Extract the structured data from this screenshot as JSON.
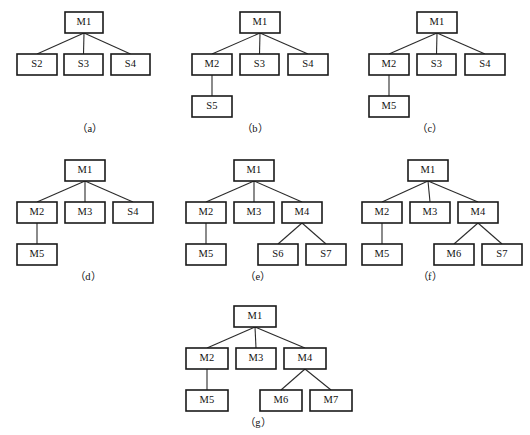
{
  "figure": {
    "background_color": "#ffffff",
    "box_stroke_color": "#1a1a1a",
    "edge_stroke_color": "#2b2b2b",
    "text_color": "#111111",
    "panel_count": 7
  },
  "panels": [
    {
      "id": "a",
      "caption": "（a）",
      "origin": {
        "x": 0,
        "y": 0
      },
      "caption_pos": {
        "x": 60,
        "y": 120,
        "width": 60
      },
      "nodes": [
        {
          "key": "n1",
          "label": "M1",
          "x": 65,
          "y": 12,
          "w": 38,
          "h": 21
        },
        {
          "key": "n2",
          "label": "S2",
          "x": 17,
          "y": 54,
          "w": 40,
          "h": 21
        },
        {
          "key": "n3",
          "label": "S3",
          "x": 64,
          "y": 54,
          "w": 39,
          "h": 21
        },
        {
          "key": "n4",
          "label": "S4",
          "x": 111,
          "y": 54,
          "w": 39,
          "h": 21
        }
      ],
      "edges": [
        {
          "from": "n1",
          "to": "n2"
        },
        {
          "from": "n1",
          "to": "n3"
        },
        {
          "from": "n1",
          "to": "n4"
        }
      ]
    },
    {
      "id": "b",
      "caption": "（b）",
      "origin": {
        "x": 180,
        "y": 0
      },
      "caption_pos": {
        "x": 225,
        "y": 120,
        "width": 60
      },
      "nodes": [
        {
          "key": "n1",
          "label": "M1",
          "x": 60,
          "y": 12,
          "w": 40,
          "h": 21
        },
        {
          "key": "n2",
          "label": "M2",
          "x": 12,
          "y": 54,
          "w": 40,
          "h": 21
        },
        {
          "key": "n3",
          "label": "S3",
          "x": 60,
          "y": 54,
          "w": 39,
          "h": 21
        },
        {
          "key": "n4",
          "label": "S4",
          "x": 108,
          "y": 54,
          "w": 40,
          "h": 21
        },
        {
          "key": "n5",
          "label": "S5",
          "x": 12,
          "y": 96,
          "w": 40,
          "h": 21
        }
      ],
      "edges": [
        {
          "from": "n1",
          "to": "n2"
        },
        {
          "from": "n1",
          "to": "n3"
        },
        {
          "from": "n1",
          "to": "n4"
        },
        {
          "from": "n2",
          "to": "n5"
        }
      ]
    },
    {
      "id": "c",
      "caption": "（c）",
      "origin": {
        "x": 360,
        "y": 0
      },
      "caption_pos": {
        "x": 400,
        "y": 120,
        "width": 60
      },
      "nodes": [
        {
          "key": "n1",
          "label": "M1",
          "x": 57,
          "y": 12,
          "w": 40,
          "h": 21
        },
        {
          "key": "n2",
          "label": "M2",
          "x": 9,
          "y": 54,
          "w": 40,
          "h": 21
        },
        {
          "key": "n3",
          "label": "S3",
          "x": 57,
          "y": 54,
          "w": 39,
          "h": 21
        },
        {
          "key": "n4",
          "label": "S4",
          "x": 105,
          "y": 54,
          "w": 40,
          "h": 21
        },
        {
          "key": "n5",
          "label": "M5",
          "x": 9,
          "y": 96,
          "w": 40,
          "h": 21
        }
      ],
      "edges": [
        {
          "from": "n1",
          "to": "n2"
        },
        {
          "from": "n1",
          "to": "n3"
        },
        {
          "from": "n1",
          "to": "n4"
        },
        {
          "from": "n2",
          "to": "n5"
        }
      ]
    },
    {
      "id": "d",
      "caption": "（d）",
      "origin": {
        "x": 0,
        "y": 148
      },
      "caption_pos": {
        "x": 58,
        "y": 268,
        "width": 60
      },
      "nodes": [
        {
          "key": "n1",
          "label": "M1",
          "x": 65,
          "y": 12,
          "w": 40,
          "h": 21
        },
        {
          "key": "n2",
          "label": "M2",
          "x": 17,
          "y": 54,
          "w": 40,
          "h": 21
        },
        {
          "key": "n3",
          "label": "M3",
          "x": 65,
          "y": 54,
          "w": 40,
          "h": 21
        },
        {
          "key": "n4",
          "label": "S4",
          "x": 113,
          "y": 54,
          "w": 40,
          "h": 21
        },
        {
          "key": "n5",
          "label": "M5",
          "x": 17,
          "y": 96,
          "w": 40,
          "h": 21
        }
      ],
      "edges": [
        {
          "from": "n1",
          "to": "n2"
        },
        {
          "from": "n1",
          "to": "n3"
        },
        {
          "from": "n1",
          "to": "n4"
        },
        {
          "from": "n2",
          "to": "n5"
        }
      ]
    },
    {
      "id": "e",
      "caption": "（e）",
      "origin": {
        "x": 178,
        "y": 148
      },
      "caption_pos": {
        "x": 228,
        "y": 268,
        "width": 60
      },
      "nodes": [
        {
          "key": "n1",
          "label": "M1",
          "x": 56,
          "y": 12,
          "w": 40,
          "h": 21
        },
        {
          "key": "n2",
          "label": "M2",
          "x": 8,
          "y": 54,
          "w": 40,
          "h": 21
        },
        {
          "key": "n3",
          "label": "M3",
          "x": 56,
          "y": 54,
          "w": 40,
          "h": 21
        },
        {
          "key": "n4",
          "label": "M4",
          "x": 104,
          "y": 54,
          "w": 40,
          "h": 21
        },
        {
          "key": "n5",
          "label": "M5",
          "x": 8,
          "y": 96,
          "w": 40,
          "h": 21
        },
        {
          "key": "n6",
          "label": "S6",
          "x": 80,
          "y": 96,
          "w": 40,
          "h": 21
        },
        {
          "key": "n7",
          "label": "S7",
          "x": 128,
          "y": 96,
          "w": 40,
          "h": 21
        }
      ],
      "edges": [
        {
          "from": "n1",
          "to": "n2"
        },
        {
          "from": "n1",
          "to": "n3"
        },
        {
          "from": "n1",
          "to": "n4"
        },
        {
          "from": "n2",
          "to": "n5"
        },
        {
          "from": "n4",
          "to": "n6"
        },
        {
          "from": "n4",
          "to": "n7"
        }
      ]
    },
    {
      "id": "f",
      "caption": "（f）",
      "origin": {
        "x": 356,
        "y": 148
      },
      "caption_pos": {
        "x": 400,
        "y": 268,
        "width": 60
      },
      "nodes": [
        {
          "key": "n1",
          "label": "M1",
          "x": 52,
          "y": 12,
          "w": 40,
          "h": 21
        },
        {
          "key": "n2",
          "label": "M2",
          "x": 6,
          "y": 54,
          "w": 40,
          "h": 21
        },
        {
          "key": "n3",
          "label": "M3",
          "x": 54,
          "y": 54,
          "w": 40,
          "h": 21
        },
        {
          "key": "n4",
          "label": "M4",
          "x": 102,
          "y": 54,
          "w": 40,
          "h": 21
        },
        {
          "key": "n5",
          "label": "M5",
          "x": 6,
          "y": 96,
          "w": 40,
          "h": 21
        },
        {
          "key": "n6",
          "label": "M6",
          "x": 78,
          "y": 96,
          "w": 40,
          "h": 21
        },
        {
          "key": "n7",
          "label": "S7",
          "x": 126,
          "y": 96,
          "w": 40,
          "h": 21
        }
      ],
      "edges": [
        {
          "from": "n1",
          "to": "n2"
        },
        {
          "from": "n1",
          "to": "n3"
        },
        {
          "from": "n1",
          "to": "n4"
        },
        {
          "from": "n2",
          "to": "n5"
        },
        {
          "from": "n4",
          "to": "n6"
        },
        {
          "from": "n4",
          "to": "n7"
        }
      ]
    },
    {
      "id": "g",
      "caption": "（g）",
      "origin": {
        "x": 178,
        "y": 294
      },
      "caption_pos": {
        "x": 228,
        "y": 414,
        "width": 60
      },
      "nodes": [
        {
          "key": "n1",
          "label": "M1",
          "x": 56,
          "y": 12,
          "w": 42,
          "h": 21
        },
        {
          "key": "n2",
          "label": "M2",
          "x": 8,
          "y": 54,
          "w": 42,
          "h": 21
        },
        {
          "key": "n3",
          "label": "M3",
          "x": 58,
          "y": 54,
          "w": 40,
          "h": 21
        },
        {
          "key": "n4",
          "label": "M4",
          "x": 106,
          "y": 54,
          "w": 42,
          "h": 21
        },
        {
          "key": "n5",
          "label": "M5",
          "x": 8,
          "y": 96,
          "w": 42,
          "h": 21
        },
        {
          "key": "n6",
          "label": "M6",
          "x": 82,
          "y": 96,
          "w": 42,
          "h": 21
        },
        {
          "key": "n7",
          "label": "M7",
          "x": 132,
          "y": 96,
          "w": 42,
          "h": 21
        }
      ],
      "edges": [
        {
          "from": "n1",
          "to": "n2"
        },
        {
          "from": "n1",
          "to": "n3"
        },
        {
          "from": "n1",
          "to": "n4"
        },
        {
          "from": "n2",
          "to": "n5"
        },
        {
          "from": "n4",
          "to": "n6"
        },
        {
          "from": "n4",
          "to": "n7"
        }
      ]
    }
  ]
}
